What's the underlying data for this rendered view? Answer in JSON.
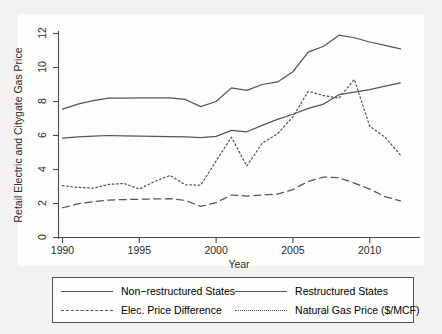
{
  "chart_data": {
    "type": "line",
    "title": "",
    "xlabel": "Year",
    "ylabel": "Retail Electric and Citygate Gas Price",
    "xlim": [
      1990,
      2012
    ],
    "ylim": [
      0,
      12
    ],
    "xticks": [
      "1990",
      "1995",
      "2000",
      "2005",
      "2010"
    ],
    "xtick_values": [
      1990,
      1995,
      2000,
      2005,
      2010
    ],
    "yticks": [
      "0",
      "2",
      "4",
      "6",
      "8",
      "10",
      "12"
    ],
    "ytick_values": [
      0,
      2,
      4,
      6,
      8,
      10,
      12
    ],
    "grid": false,
    "legend_position": "below-plot",
    "x": [
      1990,
      1991,
      1992,
      1993,
      1994,
      1995,
      1996,
      1997,
      1998,
      1999,
      2000,
      2001,
      2002,
      2003,
      2004,
      2005,
      2006,
      2007,
      2008,
      2009,
      2010,
      2011,
      2012
    ],
    "series": [
      {
        "name": "Non-restructured States",
        "style": "solid",
        "values": [
          7.55,
          7.85,
          8.05,
          8.2,
          8.2,
          8.22,
          8.22,
          8.22,
          8.12,
          7.7,
          8.0,
          8.8,
          8.65,
          9.0,
          9.15,
          9.75,
          10.9,
          11.25,
          11.9,
          11.75,
          11.5,
          11.3,
          11.1
        ]
      },
      {
        "name": "Restructured States",
        "style": "solid",
        "values": [
          5.85,
          5.92,
          5.97,
          6.0,
          5.98,
          5.96,
          5.95,
          5.94,
          5.92,
          5.88,
          5.95,
          6.3,
          6.22,
          6.6,
          6.95,
          7.25,
          7.6,
          7.85,
          8.4,
          8.55,
          8.7,
          8.9,
          9.1
        ]
      },
      {
        "name": "Elec. Price Difference",
        "style": "dashed",
        "values": [
          1.75,
          1.98,
          2.1,
          2.2,
          2.23,
          2.25,
          2.27,
          2.28,
          2.18,
          1.83,
          2.05,
          2.5,
          2.44,
          2.5,
          2.55,
          2.82,
          3.3,
          3.55,
          3.52,
          3.2,
          2.85,
          2.4,
          2.15
        ]
      },
      {
        "name": "Natural Gas Price ($/MCF)",
        "style": "dotted",
        "values": [
          3.05,
          2.95,
          2.9,
          3.12,
          3.18,
          2.85,
          3.3,
          3.65,
          3.1,
          3.08,
          4.5,
          5.9,
          4.2,
          5.55,
          6.1,
          7.1,
          8.6,
          8.35,
          8.2,
          9.3,
          6.55,
          5.9,
          4.85
        ]
      }
    ],
    "legend": [
      {
        "label": "Non−restructured States",
        "style": "solid"
      },
      {
        "label": "Restructured States",
        "style": "solid"
      },
      {
        "label": "Elec. Price Difference",
        "style": "dashed"
      },
      {
        "label": "Natural Gas Price ($/MCF)",
        "style": "dotted"
      }
    ],
    "colors": {
      "line": "#555556",
      "axis": "#4a4a4a",
      "text": "#2b2b2b",
      "plot_background": "#fdfdfc",
      "figure_background": "#f3f2f0"
    }
  }
}
